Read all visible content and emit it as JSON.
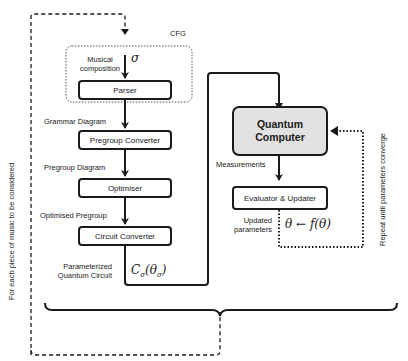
{
  "cfg": {
    "label": "CFG"
  },
  "input": {
    "label_line1": "Musical",
    "label_line2": "composition",
    "symbol": "σ"
  },
  "boxes": {
    "parser": "Parser",
    "pregroup_converter": "Pregroup Converter",
    "optimiser": "Optimiser",
    "circuit_converter": "Circuit Converter",
    "quantum_computer_line1": "Quantum",
    "quantum_computer_line2": "Computer",
    "evaluator": "Evaluator & Updater"
  },
  "edge_labels": {
    "grammar_diagram": "Grammar Diagram",
    "pregroup_diagram": "Pregroup Diagram",
    "optimised_pregroup": "Optimised Pregroup",
    "param_circuit_line1": "Parameterized",
    "param_circuit_line2": "Quantum  Circuit",
    "circuit_formula": "C",
    "circuit_formula_sub": "σ",
    "circuit_formula_arg": "(θ",
    "circuit_formula_arg_sub": "σ",
    "circuit_formula_close": ")",
    "measurements": "Measurements",
    "updated_line1": "Updated",
    "updated_line2": "parameters",
    "update_formula": "θ ← f(θ)"
  },
  "side_labels": {
    "left": "For each piece of music to be considered",
    "right": "Repeat until parameters converge"
  }
}
